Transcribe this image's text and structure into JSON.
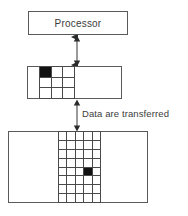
{
  "diagram": {
    "title_text": "Processor",
    "caption_text": "Data are transferred",
    "stroke_color": "#5a5a5a",
    "grid_line_color": "#4a4a4a",
    "filled_cell_color": "#111111",
    "background_color": "#ffffff",
    "blocks": [
      {
        "name": "processor",
        "label": "Processor",
        "shape": "rectangle",
        "has_grid": false
      },
      {
        "name": "cache",
        "label": "",
        "shape": "rectangle",
        "has_grid": true,
        "grid_columns": 3,
        "grid_rows": 3,
        "filled_cells": [
          {
            "row": 1,
            "col": 1
          }
        ]
      },
      {
        "name": "memory",
        "label": "",
        "shape": "rectangle",
        "has_grid": true,
        "grid_columns": 5,
        "grid_rows": 8,
        "filled_cells": [
          {
            "row": 5,
            "col": 4
          }
        ]
      }
    ],
    "connectors": [
      {
        "name": "processor-cache-arrow",
        "from": "processor",
        "to": "cache",
        "style": "double-headed-vertical",
        "label": ""
      },
      {
        "name": "cache-memory-arrow",
        "from": "cache",
        "to": "memory",
        "style": "double-headed-vertical",
        "label": "Data are transferred"
      }
    ]
  }
}
